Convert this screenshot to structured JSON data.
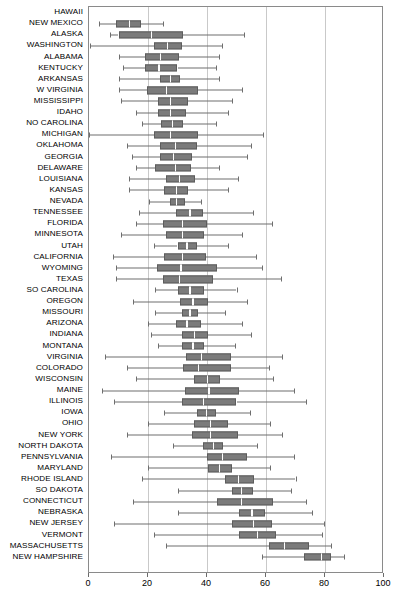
{
  "chart_data": {
    "type": "box",
    "title": "",
    "xlabel": "",
    "ylabel": "",
    "xlim": [
      0,
      100
    ],
    "xticks": [
      0,
      20,
      40,
      60,
      80,
      100
    ],
    "grid": true,
    "orientation": "horizontal",
    "legend": "none",
    "categories": [
      "HAWAII",
      "NEW MEXICO",
      "ALASKA",
      "WASHINGTON",
      "ALABAMA",
      "KENTUCKY",
      "ARKANSAS",
      "W VIRGINIA",
      "MISSISSIPPI",
      "IDAHO",
      "NO CAROLINA",
      "MICHIGAN",
      "OKLAHOMA",
      "GEORGIA",
      "DELAWARE",
      "LOUISIANA",
      "KANSAS",
      "NEVADA",
      "TENNESSEE",
      "FLORIDA",
      "MINNESOTA",
      "UTAH",
      "CALIFORNIA",
      "WYOMING",
      "TEXAS",
      "SO CAROLINA",
      "OREGON",
      "MISSOURI",
      "ARIZONA",
      "INDIANA",
      "MONTANA",
      "VIRGINIA",
      "COLORADO",
      "WISCONSIN",
      "MAINE",
      "ILLINOIS",
      "IOWA",
      "OHIO",
      "NEW YORK",
      "NORTH DAKOTA",
      "PENNSYLVANIA",
      "MARYLAND",
      "RHODE ISLAND",
      "SO DAKOTA",
      "CONNECTICUT",
      "NEBRASKA",
      "NEW JERSEY",
      "VERMONT",
      "MASSACHUSETTS",
      "NEW HAMPSHIRE"
    ],
    "boxes": [
      {
        "name": "HAWAII",
        "low": null,
        "q1": null,
        "median": null,
        "q3": null,
        "high": null
      },
      {
        "name": "NEW MEXICO",
        "low": 3.5,
        "q1": 9.0,
        "median": 13.5,
        "q3": 17.5,
        "high": 25.0
      },
      {
        "name": "ALASKA",
        "low": 7.0,
        "q1": 10.0,
        "median": 21.0,
        "q3": 32.0,
        "high": 52.5
      },
      {
        "name": "WASHINGTON",
        "low": 0.5,
        "q1": 22.0,
        "median": 26.5,
        "q3": 31.5,
        "high": 45.0
      },
      {
        "name": "ALABAMA",
        "low": 10.0,
        "q1": 19.0,
        "median": 24.0,
        "q3": 30.5,
        "high": 44.0
      },
      {
        "name": "KENTUCKY",
        "low": 11.5,
        "q1": 19.0,
        "median": 23.5,
        "q3": 30.0,
        "high": 43.0
      },
      {
        "name": "ARKANSAS",
        "low": 10.0,
        "q1": 24.0,
        "median": 27.5,
        "q3": 31.0,
        "high": 44.0
      },
      {
        "name": "W VIRGINIA",
        "low": 10.0,
        "q1": 19.5,
        "median": 26.0,
        "q3": 37.0,
        "high": 52.0
      },
      {
        "name": "MISSISSIPPI",
        "low": 11.0,
        "q1": 23.5,
        "median": 27.5,
        "q3": 33.5,
        "high": 48.5
      },
      {
        "name": "IDAHO",
        "low": 16.0,
        "q1": 23.5,
        "median": 27.5,
        "q3": 33.0,
        "high": 47.0
      },
      {
        "name": "NO CAROLINA",
        "low": 18.0,
        "q1": 24.5,
        "median": 28.0,
        "q3": 32.0,
        "high": 43.0
      },
      {
        "name": "MICHIGAN",
        "low": 0.0,
        "q1": 22.0,
        "median": 27.5,
        "q3": 37.0,
        "high": 59.0
      },
      {
        "name": "OKLAHOMA",
        "low": 13.0,
        "q1": 24.0,
        "median": 29.0,
        "q3": 36.5,
        "high": 55.0
      },
      {
        "name": "GEORGIA",
        "low": 14.5,
        "q1": 24.0,
        "median": 28.5,
        "q3": 35.0,
        "high": 53.5
      },
      {
        "name": "DELAWARE",
        "low": 16.0,
        "q1": 22.5,
        "median": 29.0,
        "q3": 34.5,
        "high": 44.0
      },
      {
        "name": "LOUISIANA",
        "low": 13.5,
        "q1": 26.0,
        "median": 30.5,
        "q3": 36.0,
        "high": 50.5
      },
      {
        "name": "KANSAS",
        "low": 13.5,
        "q1": 25.5,
        "median": 29.5,
        "q3": 33.5,
        "high": 47.0
      },
      {
        "name": "NEVADA",
        "low": 20.5,
        "q1": 27.5,
        "median": 29.5,
        "q3": 32.5,
        "high": 38.0
      },
      {
        "name": "TENNESSEE",
        "low": 17.0,
        "q1": 29.5,
        "median": 34.0,
        "q3": 38.5,
        "high": 55.5
      },
      {
        "name": "FLORIDA",
        "low": 16.0,
        "q1": 25.0,
        "median": 31.5,
        "q3": 40.0,
        "high": 62.0
      },
      {
        "name": "MINNESOTA",
        "low": 11.0,
        "q1": 26.0,
        "median": 31.5,
        "q3": 39.0,
        "high": 52.0
      },
      {
        "name": "UTAH",
        "low": 22.0,
        "q1": 30.0,
        "median": 33.0,
        "q3": 36.5,
        "high": 47.0
      },
      {
        "name": "CALIFORNIA",
        "low": 8.0,
        "q1": 25.5,
        "median": 31.5,
        "q3": 39.5,
        "high": 56.5
      },
      {
        "name": "WYOMING",
        "low": 9.0,
        "q1": 23.0,
        "median": 31.0,
        "q3": 43.5,
        "high": 58.5
      },
      {
        "name": "TEXAS",
        "low": 9.0,
        "q1": 25.0,
        "median": 30.5,
        "q3": 42.0,
        "high": 65.0
      },
      {
        "name": "SO CAROLINA",
        "low": 22.5,
        "q1": 30.0,
        "median": 34.0,
        "q3": 39.0,
        "high": 50.0
      },
      {
        "name": "OREGON",
        "low": 15.0,
        "q1": 31.0,
        "median": 35.0,
        "q3": 40.5,
        "high": 53.5
      },
      {
        "name": "MISSOURI",
        "low": 22.5,
        "q1": 31.5,
        "median": 34.0,
        "q3": 37.0,
        "high": 46.0
      },
      {
        "name": "ARIZONA",
        "low": 20.0,
        "q1": 29.5,
        "median": 33.0,
        "q3": 38.0,
        "high": 52.0
      },
      {
        "name": "INDIANA",
        "low": 21.0,
        "q1": 31.5,
        "median": 35.5,
        "q3": 40.5,
        "high": 55.0
      },
      {
        "name": "MONTANA",
        "low": 23.5,
        "q1": 31.5,
        "median": 35.0,
        "q3": 39.0,
        "high": 49.5
      },
      {
        "name": "VIRGINIA",
        "low": 5.5,
        "q1": 33.0,
        "median": 38.0,
        "q3": 48.0,
        "high": 65.5
      },
      {
        "name": "COLORADO",
        "low": 13.0,
        "q1": 32.0,
        "median": 37.0,
        "q3": 48.0,
        "high": 61.0
      },
      {
        "name": "WISCONSIN",
        "low": 16.0,
        "q1": 35.5,
        "median": 40.0,
        "q3": 44.5,
        "high": 62.5
      },
      {
        "name": "MAINE",
        "low": 4.5,
        "q1": 32.5,
        "median": 40.5,
        "q3": 51.0,
        "high": 69.5
      },
      {
        "name": "ILLINOIS",
        "low": 8.5,
        "q1": 31.5,
        "median": 38.5,
        "q3": 50.0,
        "high": 73.5
      },
      {
        "name": "IOWA",
        "low": 25.5,
        "q1": 36.5,
        "median": 39.5,
        "q3": 43.0,
        "high": 54.5
      },
      {
        "name": "OHIO",
        "low": 20.0,
        "q1": 35.5,
        "median": 41.0,
        "q3": 47.0,
        "high": 61.5
      },
      {
        "name": "NEW YORK",
        "low": 13.0,
        "q1": 35.0,
        "median": 41.0,
        "q3": 50.5,
        "high": 65.5
      },
      {
        "name": "NORTH DAKOTA",
        "low": 28.5,
        "q1": 38.5,
        "median": 42.0,
        "q3": 45.5,
        "high": 57.0
      },
      {
        "name": "PENNSYLVANIA",
        "low": 7.5,
        "q1": 40.0,
        "median": 45.0,
        "q3": 53.5,
        "high": 69.5
      },
      {
        "name": "MARYLAND",
        "low": 20.0,
        "q1": 40.5,
        "median": 44.0,
        "q3": 48.5,
        "high": 61.5
      },
      {
        "name": "RHODE ISLAND",
        "low": 18.0,
        "q1": 46.0,
        "median": 50.5,
        "q3": 56.0,
        "high": 70.0
      },
      {
        "name": "SO DAKOTA",
        "low": 30.0,
        "q1": 48.5,
        "median": 51.5,
        "q3": 55.5,
        "high": 68.5
      },
      {
        "name": "CONNECTICUT",
        "low": 15.0,
        "q1": 43.5,
        "median": 51.5,
        "q3": 62.5,
        "high": 73.5
      },
      {
        "name": "NEBRASKA",
        "low": 30.0,
        "q1": 51.0,
        "median": 55.0,
        "q3": 59.5,
        "high": 75.5
      },
      {
        "name": "NEW JERSEY",
        "low": 8.5,
        "q1": 48.5,
        "median": 55.5,
        "q3": 62.0,
        "high": 79.5
      },
      {
        "name": "VERMONT",
        "low": 22.0,
        "q1": 51.0,
        "median": 57.0,
        "q3": 63.5,
        "high": 79.0
      },
      {
        "name": "MASSACHUSETTS",
        "low": 26.0,
        "q1": 61.0,
        "median": 66.0,
        "q3": 74.5,
        "high": 82.0
      },
      {
        "name": "NEW HAMPSHIRE",
        "low": 58.5,
        "q1": 73.0,
        "median": 78.5,
        "q3": 82.0,
        "high": 86.5
      }
    ]
  },
  "style": {
    "box_fill": "#7b7b7b",
    "box_stroke": "#5d5d5d",
    "median_color": "#ffffff",
    "whisker_color": "#6e6e6e",
    "grid_color": "#c9c9c9",
    "frame_color": "#8a8a8a",
    "background": "#ffffff"
  }
}
